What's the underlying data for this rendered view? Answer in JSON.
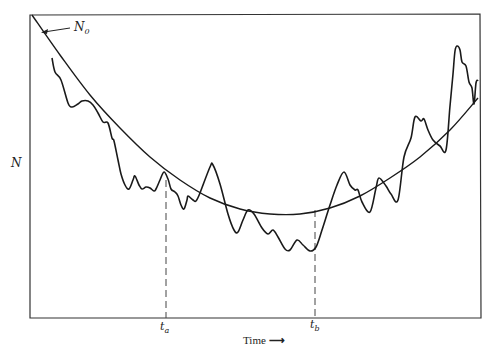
{
  "chart_data": {
    "type": "line",
    "title": "",
    "xlabel": "Time",
    "ylabel": "N",
    "grid": false,
    "legend": null,
    "axis_ticks": {
      "x": [],
      "y": []
    },
    "annotations": [
      {
        "text": "N0",
        "display": "N",
        "subscript": "0",
        "role": "initial value of N, arrow pointing to start of smooth curve"
      },
      {
        "text": "t_a",
        "display": "t",
        "subscript": "a",
        "role": "dashed vertical marker"
      },
      {
        "text": "t_b",
        "display": "t",
        "subscript": "b",
        "role": "dashed vertical marker"
      }
    ],
    "series": [
      {
        "name": "expected trend (smooth)",
        "style": "smooth",
        "points_px": [
          [
            32,
            15
          ],
          [
            60,
            55
          ],
          [
            90,
            95
          ],
          [
            120,
            128
          ],
          [
            150,
            157
          ],
          [
            180,
            180
          ],
          [
            210,
            198
          ],
          [
            240,
            209
          ],
          [
            270,
            214
          ],
          [
            300,
            214
          ],
          [
            330,
            208
          ],
          [
            360,
            196
          ],
          [
            390,
            178
          ],
          [
            420,
            157
          ],
          [
            450,
            130
          ],
          [
            478,
            98
          ]
        ]
      },
      {
        "name": "observed N (fluctuating)",
        "style": "noisy",
        "points_px": [
          [
            52,
            58
          ],
          [
            55,
            72
          ],
          [
            61,
            80
          ],
          [
            68,
            103
          ],
          [
            72,
            107
          ],
          [
            78,
            104
          ],
          [
            82,
            101
          ],
          [
            88,
            101
          ],
          [
            93,
            105
          ],
          [
            98,
            113
          ],
          [
            103,
            122
          ],
          [
            108,
            123
          ],
          [
            112,
            138
          ],
          [
            114,
            141
          ],
          [
            118,
            160
          ],
          [
            121,
            174
          ],
          [
            125,
            185
          ],
          [
            129,
            189
          ],
          [
            133,
            180
          ],
          [
            135,
            176
          ],
          [
            139,
            185
          ],
          [
            142,
            189
          ],
          [
            146,
            187
          ],
          [
            150,
            188
          ],
          [
            154,
            191
          ],
          [
            156,
            189
          ],
          [
            160,
            180
          ],
          [
            164,
            172
          ],
          [
            168,
            179
          ],
          [
            171,
            189
          ],
          [
            175,
            192
          ],
          [
            178,
            196
          ],
          [
            181,
            205
          ],
          [
            184,
            209
          ],
          [
            187,
            200
          ],
          [
            188,
            196
          ],
          [
            193,
            200
          ],
          [
            196,
            201
          ],
          [
            200,
            193
          ],
          [
            210,
            167
          ],
          [
            213,
            165
          ],
          [
            220,
            184
          ],
          [
            228,
            214
          ],
          [
            234,
            230
          ],
          [
            238,
            232
          ],
          [
            243,
            220
          ],
          [
            248,
            210
          ],
          [
            254,
            214
          ],
          [
            262,
            228
          ],
          [
            268,
            234
          ],
          [
            273,
            230
          ],
          [
            278,
            237
          ],
          [
            285,
            249
          ],
          [
            290,
            250
          ],
          [
            297,
            240
          ],
          [
            303,
            245
          ],
          [
            310,
            251
          ],
          [
            316,
            247
          ],
          [
            322,
            230
          ],
          [
            330,
            205
          ],
          [
            337,
            185
          ],
          [
            344,
            172
          ],
          [
            350,
            185
          ],
          [
            355,
            190
          ],
          [
            358,
            190
          ],
          [
            362,
            202
          ],
          [
            370,
            212
          ],
          [
            376,
            188
          ],
          [
            379,
            178
          ],
          [
            386,
            186
          ],
          [
            391,
            194
          ],
          [
            398,
            200
          ],
          [
            404,
            157
          ],
          [
            411,
            138
          ],
          [
            415,
            117
          ],
          [
            421,
            121
          ],
          [
            424,
            119
          ],
          [
            428,
            130
          ],
          [
            433,
            140
          ],
          [
            440,
            146
          ],
          [
            446,
            150
          ],
          [
            450,
            106
          ],
          [
            453,
            74
          ],
          [
            455,
            51
          ],
          [
            457,
            46
          ],
          [
            460,
            50
          ],
          [
            462,
            62
          ],
          [
            466,
            66
          ],
          [
            469,
            82
          ],
          [
            472,
            88
          ],
          [
            474,
            104
          ],
          [
            476,
            83
          ],
          [
            478,
            80
          ]
        ]
      }
    ],
    "markers": {
      "t_a_x_px": 166,
      "t_b_x_px": 315
    },
    "plot_frame_px": {
      "left": 30,
      "top": 15,
      "right": 480,
      "bottom": 318
    }
  },
  "labels": {
    "n0_main": "N",
    "n0_sub": "0",
    "y_axis": "N",
    "ta_main": "t",
    "ta_sub": "a",
    "tb_main": "t",
    "tb_sub": "b",
    "x_axis": "Time",
    "x_arrow": "⟶"
  }
}
